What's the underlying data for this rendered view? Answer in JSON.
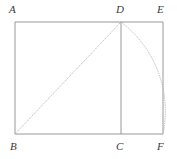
{
  "figure": {
    "kind": "geometry-diagram",
    "canvas": {
      "width": 177,
      "height": 159,
      "background": "#ffffff"
    },
    "colors": {
      "solid_stroke": "#8c8c8c",
      "dotted_stroke": "#b0b0b0",
      "label_text": "#3a3a3a"
    },
    "points": [
      {
        "id": "A",
        "label": "A",
        "x": 15,
        "y": 22,
        "label_x": 9,
        "label_y": 4
      },
      {
        "id": "D",
        "label": "D",
        "x": 121,
        "y": 22,
        "label_x": 116,
        "label_y": 4
      },
      {
        "id": "E",
        "label": "E",
        "x": 163,
        "y": 22,
        "label_x": 157,
        "label_y": 4
      },
      {
        "id": "B",
        "label": "B",
        "x": 15,
        "y": 134,
        "label_x": 10,
        "label_y": 141
      },
      {
        "id": "C",
        "label": "C",
        "x": 121,
        "y": 134,
        "label_x": 116,
        "label_y": 141
      },
      {
        "id": "F",
        "label": "F",
        "x": 163,
        "y": 134,
        "label_x": 157,
        "label_y": 141
      }
    ],
    "segments": [
      {
        "id": "AE",
        "name": "top-edge",
        "from": "A",
        "to": "E",
        "style": "solid"
      },
      {
        "id": "BF",
        "name": "bottom-edge",
        "from": "B",
        "to": "F",
        "style": "solid"
      },
      {
        "id": "AB",
        "name": "left-edge",
        "from": "A",
        "to": "B",
        "style": "solid"
      },
      {
        "id": "EF",
        "name": "right-edge",
        "from": "E",
        "to": "F",
        "style": "solid"
      },
      {
        "id": "DC",
        "name": "divider",
        "from": "D",
        "to": "C",
        "style": "solid"
      },
      {
        "id": "BD",
        "name": "diagonal",
        "from": "B",
        "to": "D",
        "style": "dotted"
      }
    ],
    "arcs": [
      {
        "id": "DF",
        "name": "arc-d-to-f",
        "from": "D",
        "to": "F",
        "center": "C",
        "radius": 112,
        "style": "dotted",
        "sweep": "clockwise"
      }
    ]
  }
}
